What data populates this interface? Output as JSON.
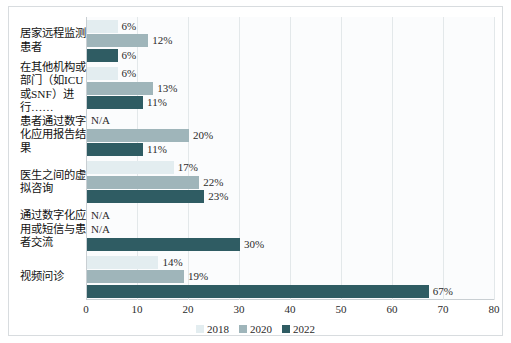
{
  "chart_data": {
    "type": "bar",
    "orientation": "horizontal",
    "title": "",
    "xlabel": "",
    "ylabel": "",
    "xlim": [
      0,
      80
    ],
    "xticks": [
      "0",
      "10",
      "20",
      "30",
      "40",
      "50",
      "60",
      "70",
      "80"
    ],
    "grid": true,
    "legend_position": "bottom",
    "categories": [
      "居家远程监测患者",
      "在其他机构或部门（如ICU或SNF）进行……",
      "患者通过数字化应用报告结果",
      "医生之间的虚拟咨询",
      "通过数字化应用或短信与患者交流",
      "视频问诊"
    ],
    "series": [
      {
        "name": "2018",
        "color": "#e3edf0",
        "values": [
          6,
          6,
          null,
          17,
          null,
          14
        ],
        "labels": [
          "6%",
          "6%",
          "N/A",
          "17%",
          "N/A",
          "14%"
        ]
      },
      {
        "name": "2020",
        "color": "#9fb5ba",
        "values": [
          12,
          13,
          20,
          22,
          null,
          19
        ],
        "labels": [
          "12%",
          "13%",
          "20%",
          "22%",
          "N/A",
          "19%"
        ]
      },
      {
        "name": "2022",
        "color": "#2f5c63",
        "values": [
          6,
          11,
          11,
          23,
          30,
          67
        ],
        "labels": [
          "6%",
          "11%",
          "11%",
          "23%",
          "30%",
          "67%"
        ]
      }
    ]
  },
  "legend": {
    "items": [
      {
        "label": "2018",
        "color": "#e3edf0"
      },
      {
        "label": "2020",
        "color": "#9fb5ba"
      },
      {
        "label": "2022",
        "color": "#2f5c63"
      }
    ]
  },
  "colors": {
    "series_2018": "#e3edf0",
    "series_2020": "#9fb5ba",
    "series_2022": "#2f5c63",
    "plot_background": "#fbfcfd",
    "gridline": "#e3e8ea",
    "frame_border": "#d8dcdf"
  }
}
